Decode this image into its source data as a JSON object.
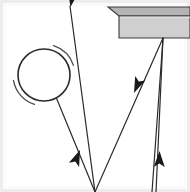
{
  "figure": {
    "type": "mechanics-diagram",
    "canvas": {
      "width": 190,
      "height": 192,
      "background": "#ffffff"
    },
    "frame": {
      "name": "image-border",
      "stroke": "#e3e3e3",
      "inner_stroke": "#f2f2f2",
      "stroke_width": 2,
      "x": 3,
      "y": 3,
      "width": 184,
      "height": 186
    },
    "stroke_color": "#2b2b2b",
    "line_width": 1.2,
    "pulley": {
      "label": "pulley-wheel",
      "cx": 44,
      "cy": 75,
      "r": 26,
      "stroke": "#2b2b2b",
      "fill": "#ffffff",
      "stroke_width": 1.6,
      "spin_arcs": [
        {
          "name": "spin-arc-upper-right",
          "cx": 44,
          "cy": 75,
          "r": 31,
          "start_deg": -72,
          "end_deg": -18
        },
        {
          "name": "spin-arc-lower-left",
          "cx": 44,
          "cy": 75,
          "r": 31,
          "start_deg": 108,
          "end_deg": 170
        }
      ]
    },
    "beam": {
      "label": "support-beam",
      "top_face_fill": "#b4b4b4",
      "front_face_fill": "#cfcfcf",
      "edge_stroke": "#3a3a3a",
      "top_face_points": "108,7 190,7 190,16 119,16",
      "front_face_points": "119,16 190,16 190,38 119,38",
      "anchor_point": {
        "x": 163,
        "y": 38,
        "name": "beam-rope-anchor"
      }
    },
    "ropes": [
      {
        "name": "rope-segment-pulley-to-bottom",
        "from": {
          "x": 56,
          "y": 97
        },
        "to": {
          "x": 95,
          "y": 192
        },
        "arrow": {
          "x": 78,
          "y": 146,
          "angle_deg": 68,
          "direction": "down-right"
        }
      },
      {
        "name": "rope-segment-bottom-to-top-left",
        "from": {
          "x": 95,
          "y": 192
        },
        "to": {
          "x": 70,
          "y": 6
        },
        "arrow": {
          "x": 73,
          "y": 16,
          "angle_deg": -98,
          "direction": "up-left"
        }
      },
      {
        "name": "rope-segment-beam-to-bottom-left",
        "from": {
          "x": 163,
          "y": 38
        },
        "to": {
          "x": 95,
          "y": 192
        },
        "arrow": null
      },
      {
        "name": "rope-segment-bottom-right-to-beam",
        "from": {
          "x": 152,
          "y": 192
        },
        "to": {
          "x": 163,
          "y": 38
        },
        "arrow": {
          "x": 137,
          "y": 99,
          "angle_deg": -66,
          "direction": "up-left"
        }
      },
      {
        "name": "rope-segment-beam-vertical-down",
        "from": {
          "x": 163,
          "y": 38
        },
        "to": {
          "x": 156,
          "y": 192
        },
        "arrow": {
          "x": 159,
          "y": 146,
          "angle_deg": 92,
          "direction": "down"
        }
      }
    ],
    "arrowheads": [
      {
        "name": "arrowhead-top-left",
        "direction": "up-left",
        "x": 73,
        "y": 16
      },
      {
        "name": "arrowhead-mid-left",
        "direction": "down-right",
        "x": 78,
        "y": 146
      },
      {
        "name": "arrowhead-mid-right",
        "direction": "up-left",
        "x": 137,
        "y": 99
      },
      {
        "name": "arrowhead-right",
        "direction": "down",
        "x": 159,
        "y": 146
      }
    ]
  }
}
